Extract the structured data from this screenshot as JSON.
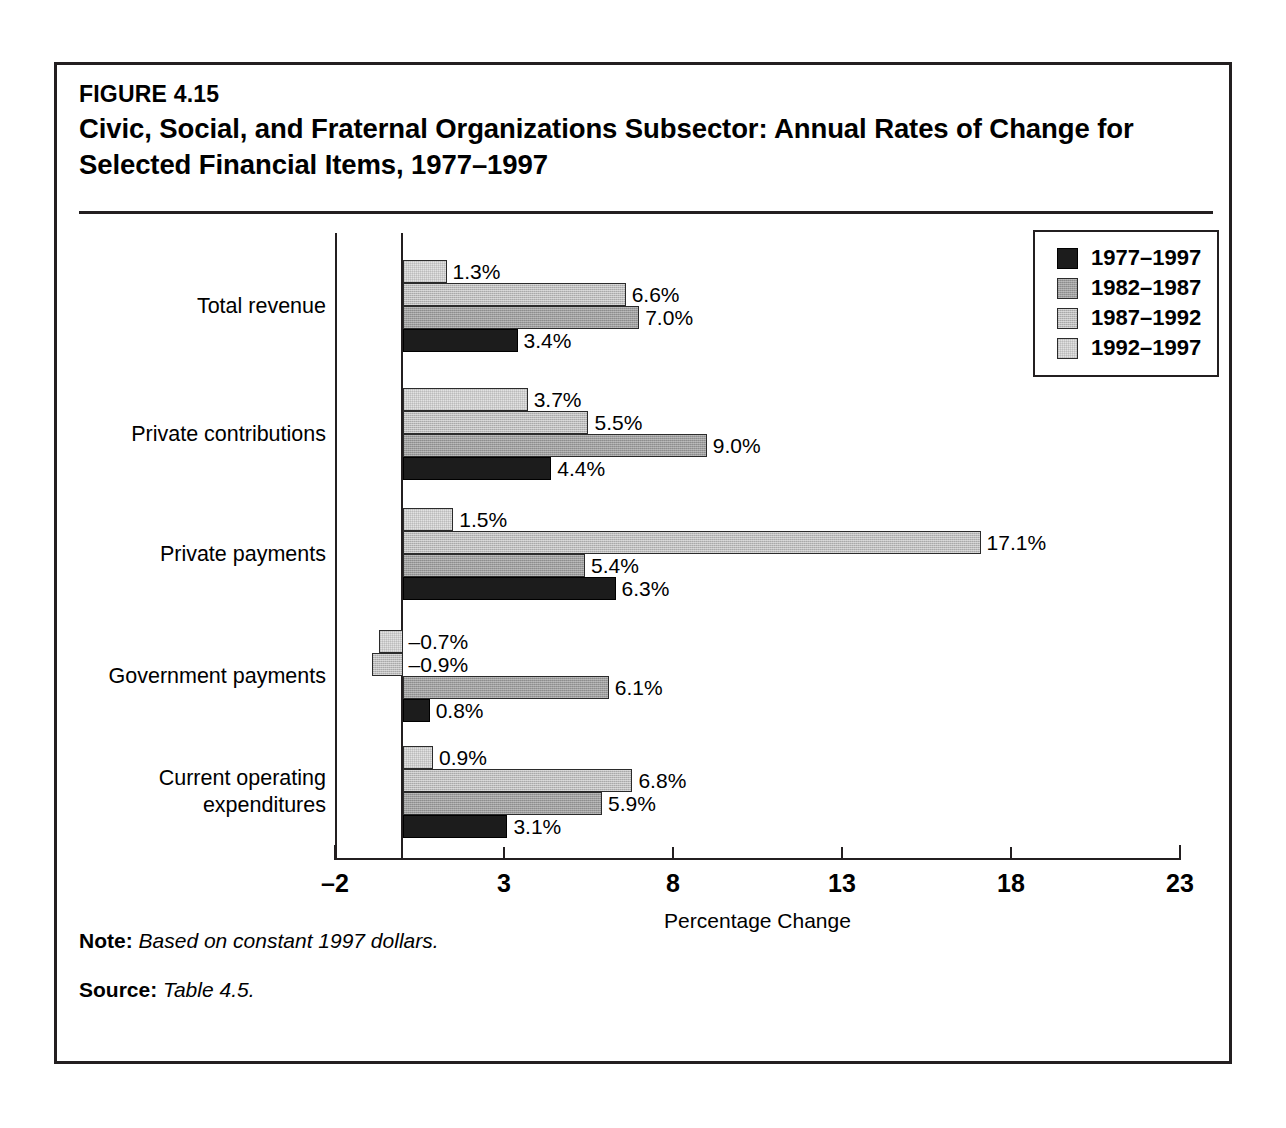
{
  "figure": {
    "number": "FIGURE 4.15",
    "title": "Civic, Social, and Fraternal Organizations Subsector: Annual Rates of Change for Selected Financial Items, 1977–1997"
  },
  "notes": {
    "note_key": "Note:",
    "note_value": "Based on constant 1997 dollars.",
    "source_key": "Source:",
    "source_value": "Table 4.5."
  },
  "legend": {
    "position": "top-right",
    "entries": [
      {
        "label": "1977–1997",
        "color": "#1c1c1c",
        "swatch": "swatch-black"
      },
      {
        "label": "1982–1987",
        "color": "#9d9d9d",
        "swatch": "swatch-dark-gray"
      },
      {
        "label": "1987–1992",
        "color": "#bcbcbc",
        "swatch": "swatch-medium-gray"
      },
      {
        "label": "1992–1997",
        "color": "#e2e2e2",
        "swatch": "swatch-light-gray"
      }
    ]
  },
  "chart_data": {
    "type": "bar",
    "orientation": "horizontal",
    "title": "Civic, Social, and Fraternal Organizations Subsector: Annual Rates of Change for Selected Financial Items, 1977–1997",
    "subtitle": "FIGURE 4.15",
    "xlabel": "Percentage Change",
    "ylabel": "",
    "xlim": [
      -2,
      23
    ],
    "xticks": [
      -2,
      3,
      8,
      13,
      18,
      23
    ],
    "xticklabels": [
      "–2",
      "3",
      "8",
      "13",
      "18",
      "23"
    ],
    "grid": false,
    "zero_line": true,
    "value_suffix": "%",
    "categories": [
      "Total revenue",
      "Private contributions",
      "Private payments",
      "Government payments",
      "Current operating\nexpenditures"
    ],
    "series": [
      {
        "name": "1977–1997",
        "color": "#1c1c1c",
        "values": [
          3.4,
          4.4,
          6.3,
          0.8,
          3.1
        ],
        "labels": [
          "3.4%",
          "4.4%",
          "6.3%",
          "0.8%",
          "3.1%"
        ]
      },
      {
        "name": "1982–1987",
        "color": "#9d9d9d",
        "values": [
          7.0,
          9.0,
          5.4,
          6.1,
          5.9
        ],
        "labels": [
          "7.0%",
          "9.0%",
          "5.4%",
          "6.1%",
          "5.9%"
        ]
      },
      {
        "name": "1987–1992",
        "color": "#bcbcbc",
        "values": [
          6.6,
          5.5,
          17.1,
          -0.9,
          6.8
        ],
        "labels": [
          "6.6%",
          "5.5%",
          "17.1%",
          "–0.9%",
          "6.8%"
        ]
      },
      {
        "name": "1992–1997",
        "color": "#e2e2e2",
        "values": [
          1.3,
          3.7,
          1.5,
          -0.7,
          0.9
        ],
        "labels": [
          "1.3%",
          "3.7%",
          "1.5%",
          "–0.7%",
          "0.9%"
        ]
      }
    ]
  }
}
